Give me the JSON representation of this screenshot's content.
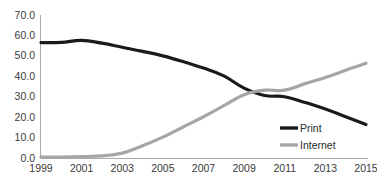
{
  "chart_data": {
    "type": "line",
    "title": "",
    "xlabel": "",
    "ylabel": "",
    "x": [
      1999,
      2000,
      2001,
      2002,
      2003,
      2004,
      2005,
      2006,
      2007,
      2008,
      2009,
      2010,
      2011,
      2012,
      2013,
      2014,
      2015
    ],
    "xtick_labels": [
      "1999",
      "2001",
      "2003",
      "2005",
      "2007",
      "2009",
      "2011",
      "2013",
      "2015"
    ],
    "xtick_values": [
      1999,
      2001,
      2003,
      2005,
      2007,
      2009,
      2011,
      2013,
      2015
    ],
    "ytick_labels": [
      "0.0",
      "10.0",
      "20.0",
      "30.0",
      "40.0",
      "50.0",
      "60.0",
      "70.0"
    ],
    "ytick_values": [
      0,
      10,
      20,
      30,
      40,
      50,
      60,
      70
    ],
    "xlim": [
      1999,
      2015
    ],
    "ylim": [
      0,
      70
    ],
    "grid": false,
    "legend_position": "inside-right",
    "series": [
      {
        "name": "Print",
        "color": "#1a1a1a",
        "values": [
          56.5,
          56.6,
          57.6,
          56.2,
          54.2,
          52.2,
          50.0,
          47.2,
          44.0,
          40.2,
          34.2,
          30.6,
          30.0,
          27.2,
          24.0,
          20.2,
          16.4
        ]
      },
      {
        "name": "Internet",
        "color": "#a6a6a6",
        "values": [
          0.4,
          0.5,
          0.7,
          1.0,
          2.4,
          6.0,
          10.2,
          15.2,
          20.2,
          25.6,
          31.0,
          33.2,
          33.2,
          36.4,
          39.4,
          43.0,
          46.4
        ]
      }
    ]
  },
  "legend": {
    "items": [
      {
        "label": "Print",
        "color": "#1a1a1a"
      },
      {
        "label": "Internet",
        "color": "#a6a6a6"
      }
    ]
  },
  "axes": {
    "y_axis_name": "value-axis",
    "x_axis_name": "category-axis"
  }
}
